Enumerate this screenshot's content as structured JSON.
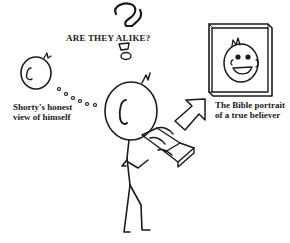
{
  "cartoon": {
    "title": "ARE THEY ALIKE?",
    "left_caption": {
      "line1": "Shorty's honest",
      "line2": "view of himself"
    },
    "right_caption": {
      "line1": "The Bible portrait",
      "line2": "of a true believer"
    },
    "colors": {
      "ink": "#1a1a1a",
      "background": "#ffffff"
    }
  }
}
